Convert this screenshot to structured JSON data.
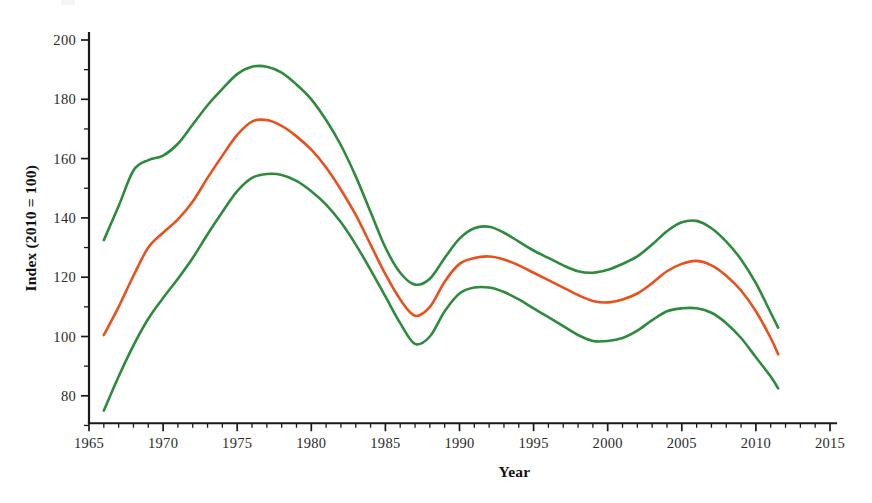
{
  "chart_data": {
    "type": "line",
    "title": "",
    "subtitle": "",
    "xlabel": "Year",
    "ylabel": "Index (2010 = 100)",
    "xlim": [
      1965,
      2015
    ],
    "ylim": [
      70,
      203
    ],
    "grid": false,
    "legend_position": "none",
    "x_major_ticks": [
      1965,
      1970,
      1975,
      1980,
      1985,
      1990,
      1995,
      2000,
      2005,
      2010,
      2015
    ],
    "x_major_tick_labels": [
      "1965",
      "1970",
      "1975",
      "1980",
      "1985",
      "1990",
      "1995",
      "2000",
      "2005",
      "2010",
      "2015"
    ],
    "x_minor_tick_interval": 1,
    "y_major_ticks": [
      80,
      100,
      120,
      140,
      160,
      180,
      200
    ],
    "y_major_tick_labels": [
      "80",
      "100",
      "120",
      "140",
      "160",
      "180",
      "200"
    ],
    "y_minor_ticks": [
      70,
      90,
      110,
      130,
      150,
      170,
      190
    ],
    "colors": {
      "upper_bound": "#2E8B3D",
      "central_estimate": "#E8501E",
      "lower_bound": "#2E8B3D",
      "axis": "#1a1a1a",
      "background": "#ffffff"
    },
    "x": [
      1966,
      1967,
      1968,
      1969,
      1970,
      1971,
      1972,
      1973,
      1974,
      1975,
      1976,
      1977,
      1978,
      1979,
      1980,
      1981,
      1982,
      1983,
      1984,
      1985,
      1986,
      1987,
      1988,
      1989,
      1990,
      1991,
      1992,
      1993,
      1994,
      1995,
      1996,
      1997,
      1998,
      1999,
      2000,
      2001,
      2002,
      2003,
      2004,
      2005,
      2006,
      2007,
      2008,
      2009,
      2010,
      2011,
      2011.5
    ],
    "series": [
      {
        "name": "Upper bound",
        "color": "#2E8B3D",
        "stroke_width": 2.6,
        "values": [
          132.5,
          144.0,
          156.0,
          159.5,
          161.0,
          165.0,
          171.5,
          178.0,
          183.5,
          188.5,
          191.0,
          191.0,
          189.0,
          185.0,
          180.0,
          173.0,
          164.5,
          154.0,
          142.0,
          130.0,
          121.5,
          117.5,
          119.5,
          126.5,
          133.0,
          136.5,
          137.0,
          135.0,
          132.0,
          129.0,
          126.5,
          124.0,
          122.0,
          121.5,
          122.5,
          124.5,
          127.0,
          131.0,
          135.5,
          138.5,
          139.0,
          136.5,
          132.0,
          126.0,
          118.0,
          108.0,
          103.0
        ]
      },
      {
        "name": "Central estimate",
        "color": "#E8501E",
        "stroke_width": 2.6,
        "values": [
          100.5,
          110.0,
          120.5,
          130.0,
          135.0,
          139.5,
          145.5,
          153.5,
          161.0,
          168.0,
          172.5,
          173.0,
          171.0,
          167.5,
          163.0,
          157.0,
          149.5,
          141.0,
          131.0,
          121.0,
          112.5,
          107.0,
          110.0,
          118.5,
          124.5,
          126.5,
          127.0,
          126.0,
          124.0,
          121.5,
          119.0,
          116.5,
          114.0,
          112.0,
          111.5,
          112.5,
          114.5,
          118.0,
          122.0,
          124.5,
          125.5,
          124.0,
          120.5,
          115.5,
          108.5,
          99.5,
          94.0
        ]
      },
      {
        "name": "Lower bound",
        "color": "#2E8B3D",
        "stroke_width": 2.6,
        "values": [
          75.0,
          86.5,
          97.0,
          106.0,
          113.0,
          119.5,
          126.5,
          134.5,
          142.0,
          149.0,
          153.5,
          154.8,
          154.5,
          152.5,
          149.0,
          144.5,
          138.5,
          131.0,
          122.5,
          113.5,
          104.5,
          97.5,
          100.0,
          108.5,
          114.5,
          116.5,
          116.5,
          115.0,
          112.5,
          109.5,
          106.5,
          103.5,
          100.5,
          98.5,
          98.5,
          99.5,
          102.0,
          105.5,
          108.5,
          109.5,
          109.5,
          108.0,
          104.5,
          99.5,
          93.0,
          86.5,
          82.5
        ]
      }
    ],
    "annotations": []
  },
  "axes": {
    "x_title": "Year",
    "y_title": "Index (2010 = 100)"
  }
}
